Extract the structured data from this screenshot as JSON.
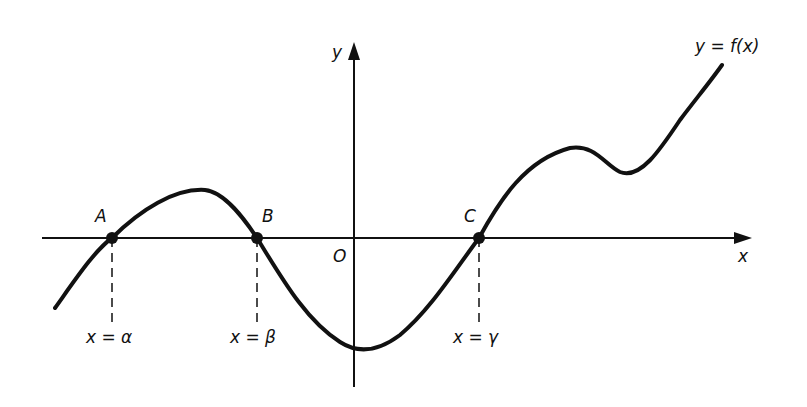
{
  "figure": {
    "curve_label": "y = f(x)",
    "axes": {
      "x_label": "x",
      "y_label": "y",
      "origin_label": "O"
    },
    "points": [
      {
        "name": "A",
        "x": 112,
        "y": 238
      },
      {
        "name": "B",
        "x": 257,
        "y": 238
      },
      {
        "name": "C",
        "x": 479,
        "y": 238
      }
    ],
    "roots": [
      {
        "label": "x = α",
        "x": 112
      },
      {
        "label": "x = β",
        "x": 257
      },
      {
        "label": "x = γ",
        "x": 479
      }
    ],
    "colors": {
      "stroke": "#111111",
      "background": "#ffffff"
    }
  }
}
